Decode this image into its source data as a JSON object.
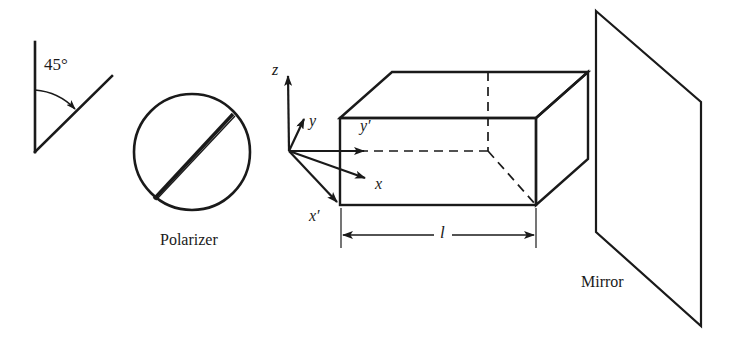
{
  "figure": {
    "background_color": "#ffffff",
    "stroke_color": "#1a1a1a",
    "width": 730,
    "height": 346
  },
  "angle_marker": {
    "label": "45°",
    "value": 45,
    "unit": "degrees",
    "vertical_line": {
      "x1": 35,
      "y1": 42,
      "x2": 35,
      "y2": 152
    },
    "diagonal_line": {
      "x1": 35,
      "y1": 152,
      "x2": 112,
      "y2": 76
    },
    "arc": {
      "cx": 35,
      "cy": 152,
      "radius": 62
    },
    "label_position": {
      "x": 44,
      "y": 56
    }
  },
  "polarizer": {
    "caption": "Polarizer",
    "circle": {
      "cx": 192,
      "cy": 152,
      "r": 58
    },
    "axis_chord": {
      "x1": 154,
      "y1": 199,
      "x2": 233,
      "y2": 114
    },
    "caption_position": {
      "x": 160,
      "y": 232
    }
  },
  "box": {
    "description": "Rectangular medium drawn in oblique projection",
    "front_face": {
      "left": 340,
      "right": 536,
      "top": 118,
      "bottom": 205
    },
    "depth_offset": {
      "dx": 52,
      "dy": -46
    },
    "hidden_edges_style": "dashed",
    "dimension": {
      "label": "l",
      "line": {
        "x1": 341,
        "y1": 235,
        "x2": 536,
        "y2": 235
      },
      "label_position": {
        "x": 438,
        "y": 224
      },
      "extension_top": 208,
      "extension_bottom": 248
    }
  },
  "axes": {
    "origin": {
      "x": 289,
      "y": 151
    },
    "items": [
      {
        "name": "z",
        "label": "z",
        "prime": false,
        "tip": {
          "x": 288,
          "y": 70
        },
        "label_position": {
          "x": 272,
          "y": 62
        }
      },
      {
        "name": "y",
        "label": "y",
        "prime": false,
        "tip": {
          "x": 305,
          "y": 114
        },
        "label_position": {
          "x": 309,
          "y": 113
        }
      },
      {
        "name": "y'",
        "label": "y",
        "prime": true,
        "tip": {
          "x": 368,
          "y": 151
        },
        "label_position": {
          "x": 360,
          "y": 118
        }
      },
      {
        "name": "x",
        "label": "x",
        "prime": false,
        "tip": {
          "x": 370,
          "y": 181
        },
        "label_position": {
          "x": 375,
          "y": 176
        }
      },
      {
        "name": "x'",
        "label": "x",
        "prime": true,
        "tip": {
          "x": 341,
          "y": 206
        },
        "label_position": {
          "x": 309,
          "y": 208
        }
      }
    ]
  },
  "mirror": {
    "caption": "Mirror",
    "corners": {
      "top_left": {
        "x": 596,
        "y": 11
      },
      "top_right": {
        "x": 701,
        "y": 102
      },
      "bottom_right": {
        "x": 701,
        "y": 326
      },
      "bottom_left": {
        "x": 596,
        "y": 232
      }
    },
    "caption_position": {
      "x": 581,
      "y": 274
    }
  }
}
